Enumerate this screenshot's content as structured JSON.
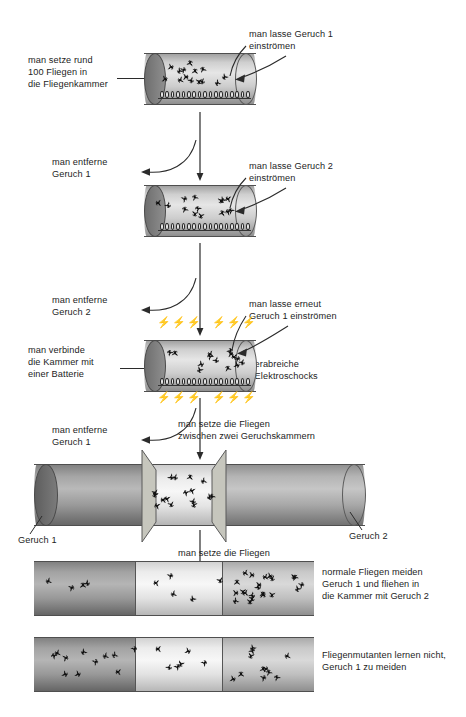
{
  "diagram": {
    "labels": {
      "step1_left": "man setze rund\n100 Fliegen in\ndie Fliegenkammer",
      "step1_right": "man lasse Geruch 1\neinströmen",
      "step2_left": "man entferne\nGeruch 1",
      "step2_right": "man lasse Geruch 2\neinströmen",
      "step3_left": "man entferne\nGeruch 2",
      "step3_right": "man lasse erneut\nGeruch 1 einströmen",
      "step3_battery": "man verbinde\ndie Kammer mit\neiner Batterie",
      "step3_shock": "man verabreiche\nkurze Elektroschocks",
      "step4_left": "man entferne\nGeruch 1",
      "step4_center": "man setze die Fliegen\nzwischen zwei Geruchskammern",
      "step4_odor1": "Geruch 1",
      "step4_odor2": "Geruch 2",
      "step5_center": "man setze die Fliegen\nbeiden Gerüchen aus",
      "result_normal": "normale Fliegen meiden\nGeruch 1 und fliehen in\ndie Kammer mit Geruch 2",
      "result_mutant": "Fliegenmutanten lernen nicht,\nGeruch 1 zu meiden"
    },
    "colors": {
      "ink": "#1d1d1d",
      "arrow": "#2b2b2b",
      "tube_dark": "#6e6e6e",
      "tube_light": "#e6e6e6",
      "fly": "#111111"
    },
    "chambers": [
      {
        "id": "chamber-1",
        "flies": 14,
        "grid": true,
        "bolts": false
      },
      {
        "id": "chamber-2",
        "flies": 14,
        "grid": true,
        "bolts": false
      },
      {
        "id": "chamber-3",
        "flies": 14,
        "grid": true,
        "bolts": true
      }
    ],
    "two_chamber": {
      "flies": 16
    },
    "results": [
      {
        "id": "normal-flies",
        "segments": [
          4,
          5,
          22
        ]
      },
      {
        "id": "mutant-flies",
        "segments": [
          11,
          6,
          11
        ]
      }
    ]
  }
}
